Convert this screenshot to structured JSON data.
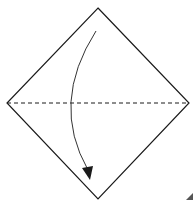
{
  "diagram": {
    "type": "origami-fold-step",
    "shape": "square-on-point",
    "fold_line": "horizontal-diagonal-valley",
    "arrow": "top-corner-to-bottom-corner",
    "colors": {
      "stroke": "#1a1a1a",
      "background": "#ffffff",
      "corner_mark": "#555555"
    }
  }
}
